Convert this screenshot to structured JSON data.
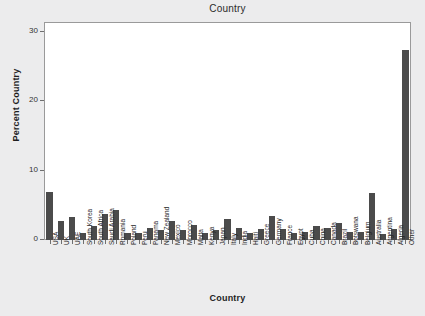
{
  "chart_data": {
    "type": "bar",
    "title": "Country",
    "xlabel": "Country",
    "ylabel": "Percent Country",
    "ylim": [
      0,
      31.4
    ],
    "yticks": [
      0,
      10,
      20,
      30
    ],
    "ytick_labels": [
      "0",
      "10",
      "20",
      "30"
    ],
    "grid": false,
    "legend": null,
    "bar_color": "#4b4b4b",
    "plot_bg": "#ffffff",
    "page_bg": "#ececed",
    "categories": [
      "USA",
      "UK",
      "UAE",
      "South Korea",
      "South Africa",
      "Saudi Arabia",
      "Romania",
      "Poland",
      "Peru",
      "Panama",
      "New Zealand",
      "Mexico",
      "Morocco",
      "Malta",
      "Kenya",
      "Japan",
      "Italy",
      "India",
      "Haiti",
      "Greece",
      "Germany",
      "France",
      "Egypt",
      "Cuba",
      "China",
      "Canada",
      "Brazil",
      "Botswana",
      "Belgium",
      "Australia",
      "Argentina",
      "Algeria",
      "Other"
    ],
    "values": [
      6.9,
      2.8,
      3.3,
      1.0,
      2.0,
      3.8,
      4.3,
      1.0,
      1.0,
      1.7,
      1.4,
      2.8,
      1.4,
      2.2,
      1.0,
      1.4,
      3.0,
      1.7,
      1.0,
      1.6,
      3.5,
      1.6,
      1.0,
      1.2,
      2.0,
      1.7,
      2.4,
      1.1,
      1.1,
      6.7,
      0.9,
      1.6,
      27.4
    ]
  }
}
